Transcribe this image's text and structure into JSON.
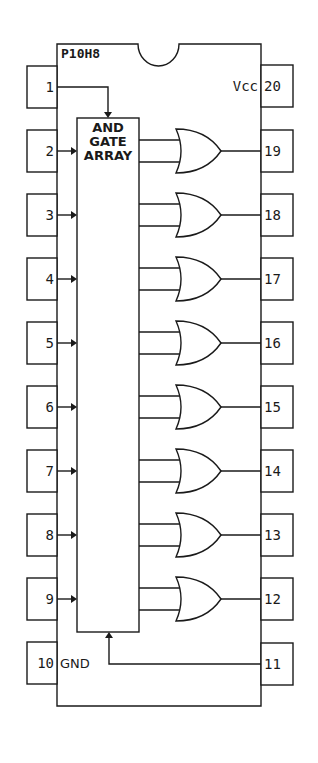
{
  "chip": {
    "part_number": "P10H8",
    "package": "DIP-20",
    "array_label": [
      "AND",
      "GATE",
      "ARRAY"
    ],
    "vcc_label": "Vcc",
    "gnd_label": "GND"
  },
  "left_pins": [
    {
      "number": "1",
      "y": 87,
      "role": "input-top"
    },
    {
      "number": "2",
      "y": 151,
      "role": "input"
    },
    {
      "number": "3",
      "y": 215,
      "role": "input"
    },
    {
      "number": "4",
      "y": 279,
      "role": "input"
    },
    {
      "number": "5",
      "y": 343,
      "role": "input"
    },
    {
      "number": "6",
      "y": 407,
      "role": "input"
    },
    {
      "number": "7",
      "y": 471,
      "role": "input"
    },
    {
      "number": "8",
      "y": 535,
      "role": "input"
    },
    {
      "number": "9",
      "y": 599,
      "role": "input"
    },
    {
      "number": "10",
      "y": 663,
      "role": "gnd"
    }
  ],
  "right_pins": [
    {
      "number": "20",
      "y": 86,
      "role": "vcc"
    },
    {
      "number": "19",
      "y": 151,
      "role": "output"
    },
    {
      "number": "18",
      "y": 215,
      "role": "output"
    },
    {
      "number": "17",
      "y": 279,
      "role": "output"
    },
    {
      "number": "16",
      "y": 343,
      "role": "output"
    },
    {
      "number": "15",
      "y": 407,
      "role": "output"
    },
    {
      "number": "14",
      "y": 471,
      "role": "output"
    },
    {
      "number": "13",
      "y": 535,
      "role": "output"
    },
    {
      "number": "12",
      "y": 599,
      "role": "output"
    },
    {
      "number": "11",
      "y": 664,
      "role": "input-bottom"
    }
  ],
  "or_gates": [
    151,
    215,
    279,
    343,
    407,
    471,
    535,
    599
  ],
  "colors": {
    "line": "#1a1a1a",
    "background": "#ffffff"
  }
}
